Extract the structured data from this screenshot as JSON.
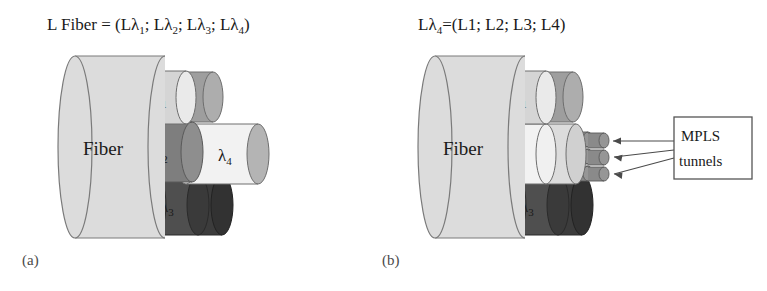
{
  "figure": {
    "background_color": "#ffffff"
  },
  "panel_a": {
    "letter": "(a)",
    "equation": {
      "prefix": "L Fiber = (L",
      "lambda": "λ",
      "sub1": "1",
      "sep1": "; L",
      "sub2": "2",
      "sep2": "; L",
      "sub3": "3",
      "sep3": "; L",
      "sub4": "4",
      "suffix": ")",
      "full_text": "L Fiber = (Lλ1; Lλ2; Lλ3; Lλ4)"
    },
    "fiber_label": "Fiber",
    "wavelengths": [
      {
        "name": "lambda-1",
        "label": "λ",
        "subscript": "1",
        "color": "#d5d5d5",
        "cap_color": "#eaeaea"
      },
      {
        "name": "lambda-2",
        "label": "λ",
        "subscript": "2",
        "color": "#8a8a8a",
        "cap_color": "#9a9a9a"
      },
      {
        "name": "lambda-3",
        "label": "λ",
        "subscript": "3",
        "color": "#4f4f4f",
        "cap_color": "#5d5d5d"
      },
      {
        "name": "lambda-4",
        "label": "λ",
        "subscript": "4",
        "color": "#f2f2f2",
        "cap_color": "#b4b4b4"
      }
    ]
  },
  "panel_b": {
    "letter": "(b)",
    "equation": {
      "prefix": "L",
      "lambda": "λ",
      "sub_main": "4",
      "eq": "=(L1; L2; L3; L4)",
      "full_text": "Lλ4=(L1; L2; L3; L4)"
    },
    "fiber_label": "Fiber",
    "wavelengths": [
      {
        "name": "lambda-1",
        "label": "λ",
        "subscript": "1",
        "color": "#d5d5d5",
        "cap_color": "#eaeaea"
      },
      {
        "name": "lambda-2",
        "label": "λ",
        "subscript": "2",
        "color": "#8a8a8a",
        "cap_color": "#9a9a9a"
      },
      {
        "name": "lambda-3",
        "label": "λ",
        "subscript": "3",
        "color": "#4f4f4f",
        "cap_color": "#5d5d5d"
      },
      {
        "name": "lambda-4",
        "label": "λ",
        "subscript": "4",
        "color": "#f2f2f2",
        "cap_color": "#dcdcdc"
      }
    ],
    "callout": {
      "line1": "MPLS",
      "line2": "tunnels",
      "border_color": "#555555",
      "fill_color": "#ffffff"
    },
    "tunnel_bundle": {
      "count": 6,
      "color": "#8a8a8a",
      "arrow_count": 3
    }
  },
  "colors": {
    "fiber_body": "#dcdcdc",
    "fiber_stroke": "#7a7a7a",
    "text": "#1a1a1a",
    "background": "#ffffff"
  }
}
